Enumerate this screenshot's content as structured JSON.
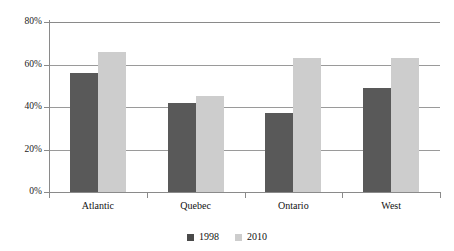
{
  "chart_data": {
    "type": "bar",
    "title": "",
    "subtitle": "",
    "xlabel": "",
    "ylabel": "",
    "categories": [
      "Atlantic",
      "Quebec",
      "Ontario",
      "West"
    ],
    "series": [
      {
        "name": "1998",
        "color": "#595959",
        "values": [
          56,
          42,
          37,
          49
        ]
      },
      {
        "name": "2010",
        "color": "#cdcdcd",
        "values": [
          66,
          45,
          63,
          63
        ]
      }
    ],
    "ylim": [
      0,
      80
    ],
    "ytick_values": [
      80,
      60,
      40,
      20,
      0
    ],
    "ytick_labels": [
      "80%",
      "60%",
      "40%",
      "20%",
      "0%"
    ],
    "grid": true,
    "legend_position": "bottom",
    "value_unit": "%"
  },
  "legend": {
    "items": [
      {
        "label": "1998",
        "swatch": "legend-swatch-1998"
      },
      {
        "label": "2010",
        "swatch": "legend-swatch-2010"
      }
    ]
  }
}
